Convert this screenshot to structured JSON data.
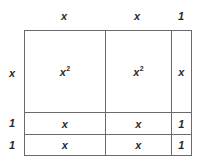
{
  "figure": {
    "type": "area-model",
    "colors": {
      "line": "#6a6a6a",
      "text": "#2b2b2b",
      "background": "#ffffff"
    }
  },
  "headers": {
    "columns": [
      {
        "label": "x",
        "value": "x"
      },
      {
        "label": "x",
        "value": "x"
      },
      {
        "label": "1",
        "value": "1"
      }
    ],
    "rows": [
      {
        "label": "x",
        "value": "x"
      },
      {
        "label": "1",
        "value": "1"
      },
      {
        "label": "1",
        "value": "1"
      }
    ]
  },
  "cells": [
    [
      {
        "base": "x",
        "exponent": "2"
      },
      {
        "base": "x",
        "exponent": "2"
      },
      {
        "base": "x",
        "exponent": ""
      }
    ],
    [
      {
        "base": "x",
        "exponent": ""
      },
      {
        "base": "x",
        "exponent": ""
      },
      {
        "base": "1",
        "exponent": ""
      }
    ],
    [
      {
        "base": "x",
        "exponent": ""
      },
      {
        "base": "x",
        "exponent": ""
      },
      {
        "base": "1",
        "exponent": ""
      }
    ]
  ]
}
